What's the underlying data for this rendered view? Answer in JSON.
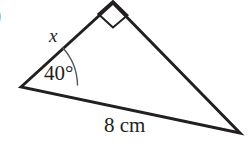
{
  "figure": {
    "type": "right-triangle-diagram",
    "item_marker": ")",
    "background_color": "#ffffff",
    "stroke_color": "#231f20",
    "stroke_width": 3,
    "vertices": {
      "left": {
        "x": 21,
        "y": 87,
        "role": "angle-vertex"
      },
      "apex": {
        "x": 113,
        "y": 3,
        "role": "right-angle-vertex"
      },
      "right": {
        "x": 240,
        "y": 133,
        "role": "base-end-vertex"
      }
    },
    "labels": {
      "unknown_side": "x",
      "angle": "40°",
      "known_side": "8 cm"
    },
    "angle_arc": {
      "radius": 57,
      "stroke_color": "#5a5558",
      "stroke_width": 1.4
    },
    "right_angle_marker": {
      "size": 22,
      "stroke_color": "#231f20",
      "stroke_width": 2
    }
  }
}
